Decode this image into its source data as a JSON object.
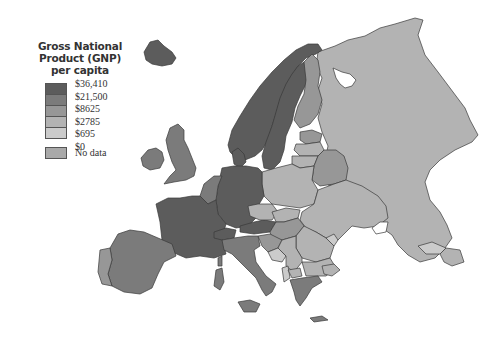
{
  "legend": {
    "title_lines": [
      "Gross National",
      "Product (GNP)",
      "per capita"
    ],
    "classes": [
      {
        "label": "$36,410",
        "color": "#5c5c5c"
      },
      {
        "label": "$21,500",
        "color": "#7b7b7b"
      },
      {
        "label": "$8625",
        "color": "#979797"
      },
      {
        "label": "$2785",
        "color": "#b3b3b3"
      },
      {
        "label": "$695",
        "color": "#cbcbcb"
      },
      {
        "label": "$0",
        "color": ""
      }
    ],
    "no_data": {
      "label": "No data",
      "color": "#a9a9a9"
    }
  },
  "map": {
    "colors": {
      "dark": "#5c5c5c",
      "midDark": "#7b7b7b",
      "mid": "#979797",
      "light": "#b3b3b3",
      "lighter": "#cbcbcb",
      "water": "#ffffff"
    }
  }
}
